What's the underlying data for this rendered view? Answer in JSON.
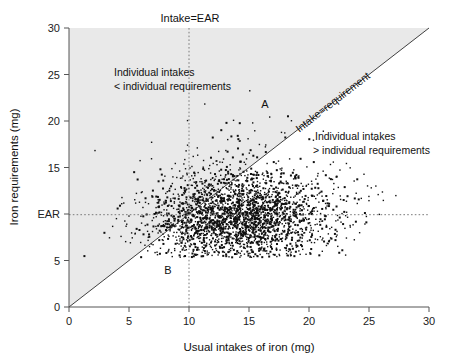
{
  "figure": {
    "top_label": "Intake=EAR",
    "diagonal_label": "Intake=requirement",
    "region_upper_letter": "A",
    "region_lower_letter": "B",
    "annotation_upper_line1": "Individual intakes",
    "annotation_upper_line2": "< individual requirements",
    "annotation_lower_line1": "Individual intakes",
    "annotation_lower_line2": "> individual requirements",
    "colors": {
      "shaded_region": "#e9e9e9",
      "point": "#101010",
      "axis": "#555555",
      "guide": "#7a7a7a",
      "identity_line": "#2b2b2b",
      "background": "#ffffff"
    }
  },
  "chart_data": {
    "type": "scatter",
    "title": "",
    "xlabel": "Usual intakes of iron (mg)",
    "ylabel": "Iron requirements (mg)",
    "xlim": [
      0,
      30
    ],
    "ylim": [
      0,
      30
    ],
    "grid": false,
    "legend": "none",
    "xticks": [
      0,
      5,
      10,
      15,
      20,
      25,
      30
    ],
    "xtick_labels": [
      "0",
      "5",
      "10",
      "15",
      "20",
      "25",
      "30"
    ],
    "yticks": [
      0,
      5,
      10,
      15,
      20,
      25,
      30
    ],
    "ytick_labels": [
      "0",
      "5",
      "EAR",
      "15",
      "20",
      "25",
      "30"
    ],
    "ear_value": 10,
    "intake_ear_value": 10,
    "reference_lines": [
      {
        "name": "Intake=EAR",
        "type": "vertical",
        "x": 10,
        "style": "dotted"
      },
      {
        "name": "EAR",
        "type": "horizontal",
        "y": 10,
        "style": "dotted"
      },
      {
        "name": "Intake=requirement",
        "type": "identity",
        "slope": 1,
        "intercept": 0,
        "style": "solid"
      }
    ],
    "shaded_region": {
      "name": "Individual intakes < individual requirements",
      "description": "Area above the identity line (requirement > intake)"
    },
    "annotations": [
      {
        "text": "Intake=EAR",
        "x": 10,
        "y": 31.2,
        "rotation": 0
      },
      {
        "text": "Individual intakes",
        "x": 3.8,
        "y": 24.6,
        "rotation": 0
      },
      {
        "text": "< individual requirements",
        "x": 3.8,
        "y": 22.8,
        "rotation": 0
      },
      {
        "text": "Intake=requirement",
        "x": 22.5,
        "y": 23.5,
        "rotation": -45
      },
      {
        "text": "Individual intakes",
        "x": 21.5,
        "y": 16.5,
        "rotation": 0
      },
      {
        "text": "> individual requirements",
        "x": 21.5,
        "y": 14.7,
        "rotation": 0
      },
      {
        "text": "A",
        "x": 15.8,
        "y": 21.6,
        "rotation": 0
      },
      {
        "text": "B",
        "x": 8.2,
        "y": 3.4,
        "rotation": 0
      }
    ],
    "n_points": 2600,
    "distribution": {
      "x": {
        "name": "Usual intakes of iron (mg)",
        "center": 14.0,
        "spread": 3.6,
        "min": 1.2,
        "max": 27.5,
        "skew": "right"
      },
      "y": {
        "name": "Iron requirements (mg)",
        "center": 9.4,
        "spread": 2.5,
        "min": 5.3,
        "max": 26.8,
        "skew": "right",
        "lower_cutoff": 5.3
      },
      "correlation": 0.05
    },
    "series": [
      {
        "name": "Individuals",
        "marker": "point",
        "color": "#101010",
        "size": 1.3,
        "note": "Each point is one individual: usual iron intake (x) vs. individual iron requirement (y)."
      }
    ]
  }
}
